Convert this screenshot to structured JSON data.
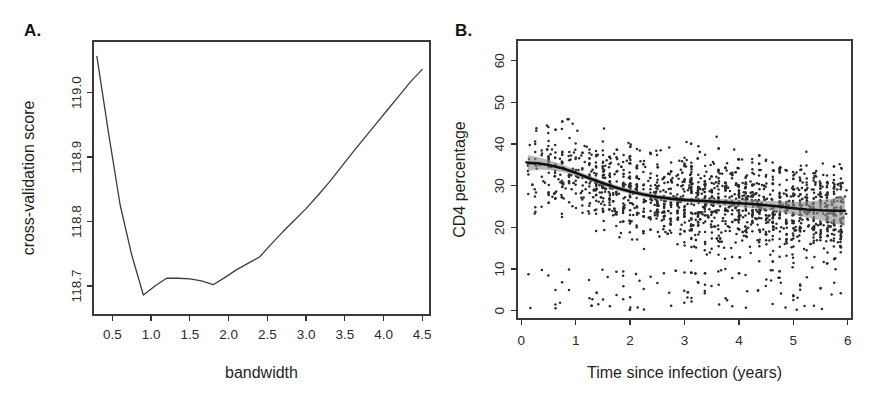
{
  "figure": {
    "panels": [
      {
        "letter": "A.",
        "name": "cross-validation-panel"
      },
      {
        "letter": "B.",
        "name": "cd4-scatter-panel"
      }
    ]
  },
  "chart_data": [
    {
      "type": "line",
      "panel": "A",
      "title": "",
      "xlabel": "bandwidth",
      "ylabel": "cross-validation score",
      "xlim": [
        0.25,
        4.6
      ],
      "ylim": [
        118.655,
        119.08
      ],
      "grid": false,
      "legend": "none",
      "xticks": [
        0.5,
        1.0,
        1.5,
        2.0,
        2.5,
        3.0,
        3.5,
        4.0,
        4.5
      ],
      "xticklabels": [
        "0.5",
        "1.0",
        "1.5",
        "2.0",
        "2.5",
        "3.0",
        "3.5",
        "4.0",
        "4.5"
      ],
      "yticks": [
        118.7,
        118.8,
        118.9,
        119.0
      ],
      "yticklabels": [
        "118.7",
        "118.8",
        "118.9",
        "119.0"
      ],
      "x": [
        0.3,
        0.45,
        0.6,
        0.75,
        0.9,
        1.05,
        1.2,
        1.35,
        1.5,
        1.65,
        1.8,
        1.95,
        2.1,
        2.25,
        2.4,
        2.55,
        2.7,
        2.85,
        3.0,
        3.15,
        3.3,
        3.45,
        3.6,
        3.75,
        3.9,
        4.05,
        4.2,
        4.35,
        4.5
      ],
      "y": [
        119.056,
        118.938,
        118.826,
        118.748,
        118.686,
        118.7,
        118.712,
        118.712,
        118.711,
        118.708,
        118.702,
        118.713,
        118.725,
        118.735,
        118.745,
        118.765,
        118.784,
        118.802,
        118.82,
        118.84,
        118.861,
        118.884,
        118.907,
        118.929,
        118.951,
        118.973,
        118.995,
        119.017,
        119.036
      ]
    },
    {
      "type": "scatter",
      "panel": "B",
      "title": "",
      "xlabel": "Time since infection (years)",
      "ylabel": "CD4 percentage",
      "xlim": [
        -0.08,
        6.08
      ],
      "ylim": [
        -2.0,
        65.0
      ],
      "grid": false,
      "legend": "none",
      "xticks": [
        0,
        1,
        2,
        3,
        4,
        5,
        6
      ],
      "xticklabels": [
        "0",
        "1",
        "2",
        "3",
        "4",
        "5",
        "6"
      ],
      "yticks": [
        0,
        10,
        20,
        30,
        40,
        50,
        60
      ],
      "yticklabels": [
        "0",
        "10",
        "20",
        "30",
        "40",
        "50",
        "60"
      ],
      "n_points": 1900,
      "point_size": 1.25,
      "scatter_note": "dense cloud of CD4 percentage measurements versus time since infection",
      "smooth": {
        "name": "loess-fit",
        "band_label": "confidence band",
        "x": [
          0.12,
          0.3,
          0.5,
          0.75,
          1.0,
          1.25,
          1.5,
          1.75,
          2.0,
          2.25,
          2.5,
          2.75,
          3.0,
          3.25,
          3.5,
          3.75,
          4.0,
          4.25,
          4.5,
          4.75,
          5.0,
          5.25,
          5.5,
          5.75,
          5.95
        ],
        "y": [
          35.5,
          35.4,
          35.0,
          34.2,
          33.1,
          31.8,
          30.6,
          29.5,
          28.6,
          27.9,
          27.3,
          26.9,
          26.6,
          26.4,
          26.2,
          26.0,
          25.8,
          25.6,
          25.3,
          25.0,
          24.6,
          24.3,
          24.1,
          24.0,
          24.0
        ],
        "lower": [
          33.6,
          33.9,
          33.8,
          33.3,
          32.4,
          31.2,
          30.0,
          28.9,
          28.0,
          27.3,
          26.7,
          26.3,
          26.0,
          25.8,
          25.5,
          25.2,
          24.9,
          24.6,
          24.2,
          23.7,
          23.1,
          22.4,
          21.7,
          21.0,
          20.4
        ],
        "upper": [
          37.4,
          36.9,
          36.2,
          35.1,
          33.8,
          32.4,
          31.2,
          30.1,
          29.2,
          28.5,
          27.9,
          27.5,
          27.2,
          27.0,
          26.9,
          26.8,
          26.7,
          26.6,
          26.4,
          26.3,
          26.1,
          26.2,
          26.5,
          27.0,
          27.6
        ]
      }
    }
  ]
}
